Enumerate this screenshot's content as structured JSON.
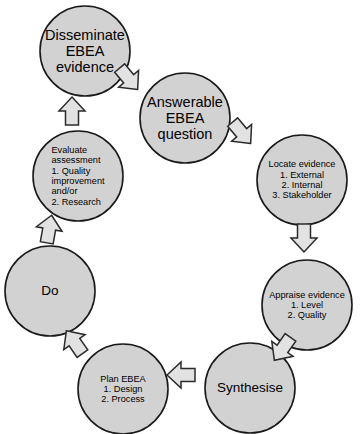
{
  "diagram": {
    "type": "cyclical-process",
    "colors": {
      "node_fill": "#d2d2d2",
      "node_stroke": "#1a1a1a",
      "arrow_fill": "#e2e2e2",
      "arrow_stroke": "#2b2b2b",
      "background": "#ffffff",
      "text": "#000000"
    },
    "nodes": [
      {
        "id": "disseminate",
        "label": "Disseminate\nEBEA\nevidence",
        "size": "big",
        "cx": 85,
        "cy": 51,
        "r": 45
      },
      {
        "id": "answerable",
        "label": "Answerable\nEBEA\nquestion",
        "size": "big",
        "cx": 185,
        "cy": 118,
        "r": 45
      },
      {
        "id": "locate",
        "label": "Locate evidence\n1. External\n2. Internal\n3. Stakeholder",
        "size": "small",
        "cx": 302,
        "cy": 180,
        "r": 45
      },
      {
        "id": "appraise",
        "label": "Appraise evidence\n1. Level\n2. Quality",
        "size": "small",
        "cx": 307,
        "cy": 305,
        "r": 45
      },
      {
        "id": "synthesise",
        "label": "Synthesise",
        "size": "med",
        "cx": 250,
        "cy": 388,
        "r": 45
      },
      {
        "id": "plan",
        "label": "Plan EBEA\n1. Design\n2. Process",
        "size": "small",
        "cx": 123,
        "cy": 389,
        "r": 45
      },
      {
        "id": "do",
        "label": "Do",
        "size": "med",
        "cx": 50,
        "cy": 291,
        "r": 45
      },
      {
        "id": "evaluate",
        "label": "Evaluate\nassessment\n1. Quality\n     improvement\n     and/or\n2. Research",
        "size": "small",
        "cx": 78,
        "cy": 176,
        "r": 45
      }
    ],
    "arrows": [
      {
        "id": "disseminate-to-answerable",
        "from": "disseminate",
        "to": "answerable",
        "direction": "down-right",
        "cx": 128,
        "cy": 78,
        "angle": 140
      },
      {
        "id": "answerable-to-locate",
        "from": "answerable",
        "to": "locate",
        "direction": "down-right",
        "cx": 241,
        "cy": 132,
        "angle": 140
      },
      {
        "id": "locate-to-appraise",
        "from": "locate",
        "to": "appraise",
        "direction": "down",
        "cx": 304,
        "cy": 237,
        "angle": 180
      },
      {
        "id": "appraise-to-synthesise",
        "from": "appraise",
        "to": "synthesise",
        "direction": "down-left",
        "cx": 283,
        "cy": 348,
        "angle": 215
      },
      {
        "id": "synthesise-to-plan",
        "from": "synthesise",
        "to": "plan",
        "direction": "left",
        "cx": 182,
        "cy": 375,
        "angle": 270
      },
      {
        "id": "plan-to-do",
        "from": "plan",
        "to": "do",
        "direction": "up-left",
        "cx": 75,
        "cy": 343,
        "angle": 325
      },
      {
        "id": "do-to-evaluate",
        "from": "do",
        "to": "evaluate",
        "direction": "up",
        "cx": 49,
        "cy": 230,
        "angle": 10
      },
      {
        "id": "evaluate-to-disseminate",
        "from": "evaluate",
        "to": "disseminate",
        "direction": "up",
        "cx": 72,
        "cy": 112,
        "angle": 0
      }
    ]
  }
}
